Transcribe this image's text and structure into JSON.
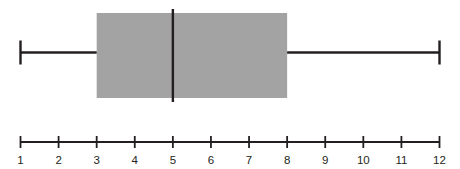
{
  "chart_data": {
    "type": "box",
    "title": "",
    "xlabel": "",
    "ylabel": "",
    "orientation": "horizontal",
    "xlim": [
      1,
      12
    ],
    "grid": false,
    "legend": null,
    "tick_labels": [
      "1",
      "2",
      "3",
      "4",
      "5",
      "6",
      "7",
      "8",
      "9",
      "10",
      "11",
      "12"
    ],
    "tick_values": [
      1,
      2,
      3,
      4,
      5,
      6,
      7,
      8,
      9,
      10,
      11,
      12
    ],
    "boxes": [
      {
        "name": "",
        "min": 1,
        "q1": 3,
        "median": 5,
        "q3": 8,
        "max": 12,
        "iqr": 5,
        "range": 11,
        "outliers": []
      }
    ],
    "colors": {
      "box_fill": "#a3a3a3",
      "line": "#231f20",
      "background": "#ffffff",
      "tick_label": "#231f20"
    }
  },
  "figure": {
    "caption": "",
    "axis_line_label": "number-line"
  }
}
